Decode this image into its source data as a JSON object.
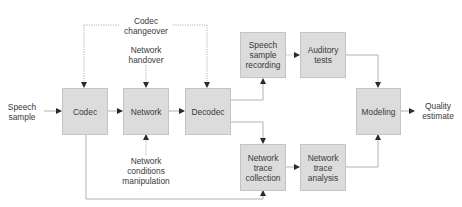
{
  "diagram": {
    "colors": {
      "box_fill": "#dcdcdc",
      "box_border": "#c4c4c4",
      "line": "#9a9a9a",
      "text": "#3a3a3a"
    },
    "nodes": {
      "codec": "Codec",
      "network": "Network",
      "decodec": "Decodec",
      "speech_sample_recording": "Speech\nsample\nrecording",
      "auditory_tests": "Auditory\ntests",
      "network_trace_collection": "Network\ntrace\ncollection",
      "network_trace_analysis": "Network\ntrace\nanalysis",
      "modeling": "Modeling"
    },
    "labels": {
      "speech_sample": "Speech\nsample",
      "codec_changeover": "Codec\nchangeover",
      "network_handover": "Network\nhandover",
      "network_conditions_manipulation": "Network\nconditions\nmanipulation",
      "quality_estimate": "Quality\nestimate"
    },
    "edges": [
      {
        "from": "Speech sample",
        "to": "Codec",
        "style": "solid"
      },
      {
        "from": "Codec",
        "to": "Network",
        "style": "solid"
      },
      {
        "from": "Network",
        "to": "Decodec",
        "style": "solid"
      },
      {
        "from": "Decodec",
        "to": "Speech sample recording",
        "style": "solid"
      },
      {
        "from": "Decodec",
        "to": "Network trace collection",
        "style": "solid"
      },
      {
        "from": "Speech sample recording",
        "to": "Auditory tests",
        "style": "dotted"
      },
      {
        "from": "Auditory tests",
        "to": "Modeling",
        "style": "solid"
      },
      {
        "from": "Network trace collection",
        "to": "Network trace analysis",
        "style": "solid"
      },
      {
        "from": "Network trace analysis",
        "to": "Modeling",
        "style": "solid"
      },
      {
        "from": "Modeling",
        "to": "Quality estimate",
        "style": "solid"
      },
      {
        "from": "Codec changeover",
        "to": "Codec",
        "style": "dotted"
      },
      {
        "from": "Codec changeover",
        "to": "Decodec",
        "style": "dotted"
      },
      {
        "from": "Network handover",
        "to": "Network",
        "style": "dotted"
      },
      {
        "from": "Network conditions manipulation",
        "to": "Network",
        "style": "dotted"
      },
      {
        "from": "Codec",
        "to": "Network trace collection",
        "style": "solid"
      }
    ]
  }
}
